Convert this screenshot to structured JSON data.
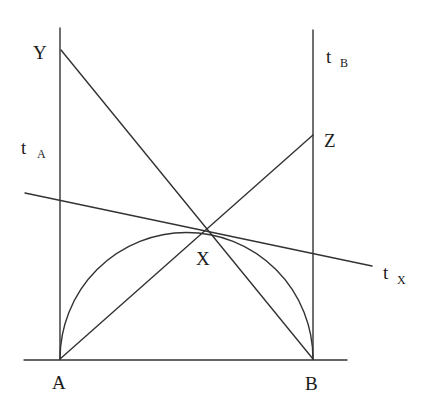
{
  "diagram": {
    "style": {
      "line_color": "#333333",
      "text_color": "#1a1a1a",
      "background": "#ffffff"
    },
    "points": {
      "A": {
        "label": "A",
        "x": 60,
        "y": 359
      },
      "B": {
        "label": "B",
        "x": 313,
        "y": 359
      },
      "X": {
        "label": "X",
        "x": 207,
        "y": 230
      },
      "Y": {
        "label": "Y",
        "x": 61,
        "y": 50
      },
      "Z": {
        "label": "Z",
        "x": 313,
        "y": 135
      }
    },
    "tangents": {
      "tA": {
        "main": "t",
        "sub": "A"
      },
      "tB": {
        "main": "t",
        "sub": "B"
      },
      "tX": {
        "main": "t",
        "sub": "X"
      }
    },
    "segments": [
      {
        "name": "tangent-line-A",
        "from": [
          60,
          28
        ],
        "to": [
          60,
          359
        ]
      },
      {
        "name": "tangent-line-B",
        "from": [
          313,
          30
        ],
        "to": [
          313,
          359
        ]
      },
      {
        "name": "base-line-AB",
        "from": [
          24,
          360
        ],
        "to": [
          347,
          360
        ]
      },
      {
        "name": "segment-YB",
        "from": [
          61,
          50
        ],
        "to": [
          313,
          359
        ]
      },
      {
        "name": "segment-AZ",
        "from": [
          60,
          359
        ],
        "to": [
          313,
          135
        ]
      },
      {
        "name": "tangent-line-X",
        "from": [
          25,
          193
        ],
        "to": [
          372,
          266
        ]
      }
    ],
    "arc": {
      "name": "semicircle-AB",
      "from": [
        60,
        359
      ],
      "to": [
        313,
        359
      ],
      "radius": 126.5
    }
  }
}
